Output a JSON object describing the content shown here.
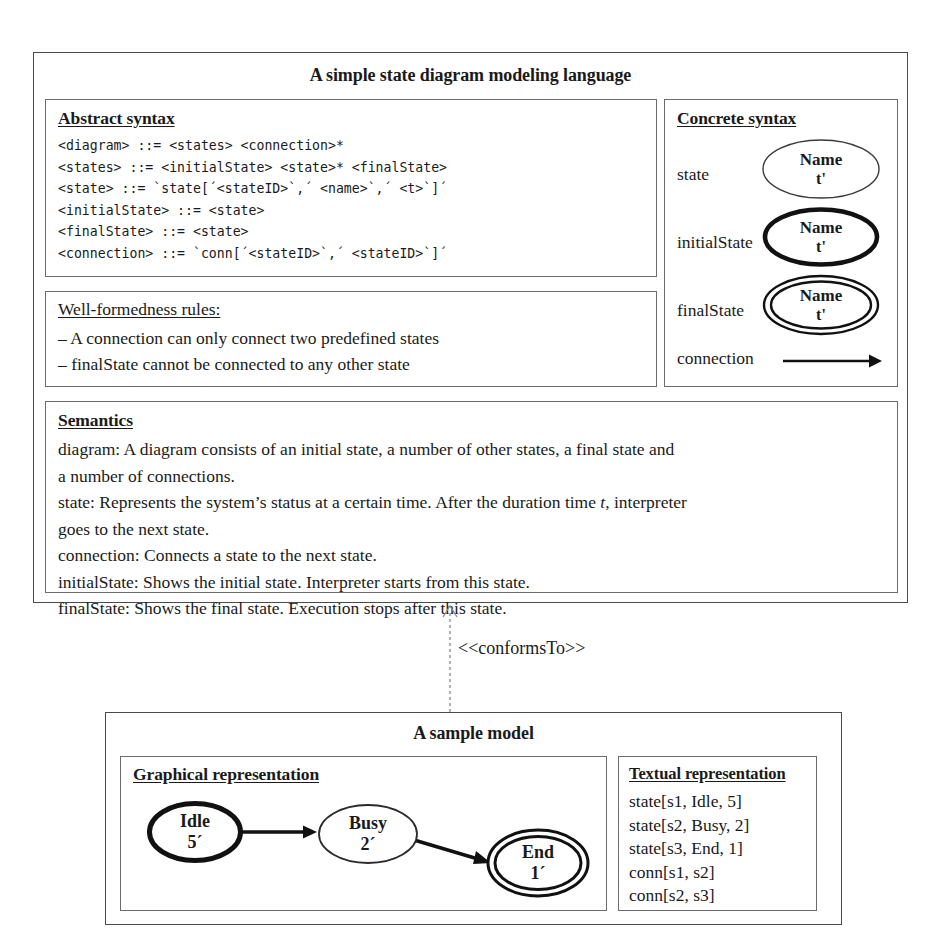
{
  "metamodel": {
    "title": "A simple state diagram modeling language",
    "abstract_syntax": {
      "title": "Abstract syntax",
      "grammar": "<diagram> ::= <states> <connection>*\n<states> ::= <initialState> <state>* <finalState>\n<state> ::= `state[´<stateID>`,´ <name>`,´ <t>`]´\n<initialState> ::= <state>\n<finalState> ::= <state>\n<connection> ::= `conn[´<stateID>`,´ <stateID>`]´"
    },
    "wellformedness": {
      "title": "Well-formedness rules:",
      "rules": [
        "– A connection can only connect two predefined states",
        "– finalState cannot be connected to any other state"
      ]
    },
    "concrete_syntax": {
      "title": "Concrete syntax",
      "rows": [
        {
          "label": "state",
          "shape": "ellipse-thin",
          "name": "Name",
          "t": "t'"
        },
        {
          "label": "initialState",
          "shape": "ellipse-thick",
          "name": "Name",
          "t": "t'"
        },
        {
          "label": "finalState",
          "shape": "ellipse-double",
          "name": "Name",
          "t": "t'"
        },
        {
          "label": "connection",
          "shape": "arrow",
          "name": "",
          "t": ""
        }
      ]
    },
    "semantics": {
      "title": "Semantics",
      "lines": [
        "diagram: A diagram consists of an initial state, a number of other states, a final state and",
        "a number  of connections.",
        "connection: Connects a state to the next state.",
        "initialState: Shows the initial state. Interpreter starts from this state.",
        "finalState: Shows the final state. Execution stops after this state."
      ],
      "state_line_pre": "state: Represents the system’s status at a certain time. After the duration time ",
      "state_line_italic": "t",
      "state_line_post": ", interpreter",
      "state_line_cont": "goes to the next state."
    }
  },
  "conforms_to": {
    "label": "<<conformsTo>>"
  },
  "model": {
    "title": "A sample model",
    "graphical": {
      "title": "Graphical representation",
      "states": [
        {
          "id": "s1",
          "name": "Idle",
          "t": "5´",
          "shape": "ellipse-thick"
        },
        {
          "id": "s2",
          "name": "Busy",
          "t": "2´",
          "shape": "ellipse-thin"
        },
        {
          "id": "s3",
          "name": "End",
          "t": "1´",
          "shape": "ellipse-double"
        }
      ],
      "connections": [
        {
          "from": "s1",
          "to": "s2"
        },
        {
          "from": "s2",
          "to": "s3"
        }
      ]
    },
    "textual": {
      "title": "Textual representation",
      "lines": [
        "state[s1, Idle, 5]",
        "state[s2, Busy, 2]",
        "state[s3, End, 1]",
        "conn[s1, s2]",
        "conn[s2, s3]"
      ]
    }
  },
  "colors": {
    "ink": "#1a1a1a",
    "frame": "#4a4a4a",
    "panel": "#6b6b6b"
  }
}
